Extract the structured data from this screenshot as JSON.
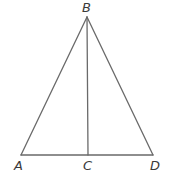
{
  "diagram": {
    "type": "triangle-with-altitude",
    "points": {
      "B": {
        "label": "B",
        "x": 87,
        "y": 17
      },
      "A": {
        "label": "A",
        "x": 21,
        "y": 155
      },
      "C": {
        "label": "C",
        "x": 88,
        "y": 155
      },
      "D": {
        "label": "D",
        "x": 153,
        "y": 155
      }
    },
    "segments": [
      "AB",
      "BD",
      "AD",
      "BC"
    ],
    "colors": {
      "line": "#6a6a6a",
      "label": "#3a3a3a",
      "background": "#ffffff"
    }
  }
}
